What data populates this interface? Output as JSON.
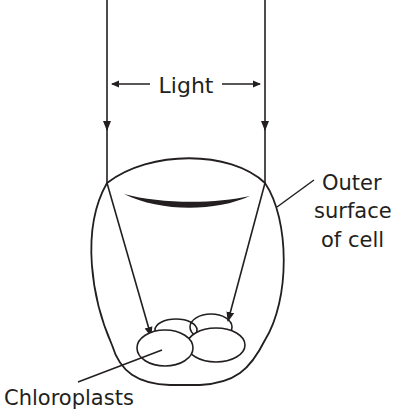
{
  "diagram": {
    "type": "biology-illustration",
    "labels": {
      "light": "Light",
      "outer_surface_line1": "Outer",
      "outer_surface_line2": "surface",
      "outer_surface_line3": "of cell",
      "chloroplasts": "Chloroplasts"
    },
    "colors": {
      "ink": "#231f20",
      "background": "#ffffff"
    }
  }
}
